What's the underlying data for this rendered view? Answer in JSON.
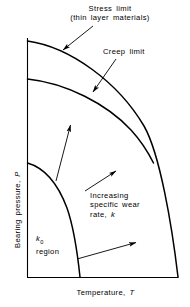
{
  "figure": {
    "type": "schematic-diagram",
    "axes": {
      "x_label_prefix": "Temperature, ",
      "x_label_symbol": "T",
      "y_label_prefix": "Bearing pressure, ",
      "y_label_symbol": "P",
      "x_origin_px": 27,
      "x_end_px": 178,
      "y_origin_px": 277,
      "y_top_px": 38
    },
    "annotations": [
      {
        "id": "stress-limit",
        "line1": "Stress limit",
        "line2": "(thin layer materials)"
      },
      {
        "id": "creep-limit",
        "text": "Creep limit"
      },
      {
        "id": "wear-rate",
        "line1": "Increasing",
        "line2": "specific wear",
        "line3_prefix": "rate, ",
        "line3_symbol": "k"
      },
      {
        "id": "k0-region",
        "line1_prefix": "k",
        "line1_subscript": "0",
        "line2": "region"
      }
    ],
    "curves": [
      {
        "name": "stress-limit-curve",
        "start_px": [
          27,
          41
        ],
        "end_px": [
          178,
          277
        ]
      },
      {
        "name": "creep-limit-curve",
        "start_px": [
          27,
          79
        ],
        "merge_px": [
          153,
          140
        ]
      },
      {
        "name": "k0-boundary-curve",
        "start_px": [
          27,
          163
        ],
        "end_px": [
          80,
          277
        ]
      }
    ],
    "arrows": [
      {
        "name": "stress-limit-leader",
        "from_px": [
          93,
          26
        ],
        "to_px": [
          62,
          51
        ]
      },
      {
        "name": "creep-limit-leader",
        "from_px": [
          115,
          60
        ],
        "to_px": [
          92,
          93
        ]
      },
      {
        "name": "wear-arrow-upper",
        "from_px": [
          56,
          181
        ],
        "to_px": [
          70,
          124
        ]
      },
      {
        "name": "wear-arrow-middle",
        "from_px": [
          85,
          191
        ],
        "to_px": [
          116,
          171
        ]
      },
      {
        "name": "wear-arrow-lower",
        "from_px": [
          77,
          259
        ],
        "to_px": [
          136,
          242
        ]
      }
    ],
    "colors": {
      "ink": "#000000",
      "background": "#ffffff"
    }
  }
}
